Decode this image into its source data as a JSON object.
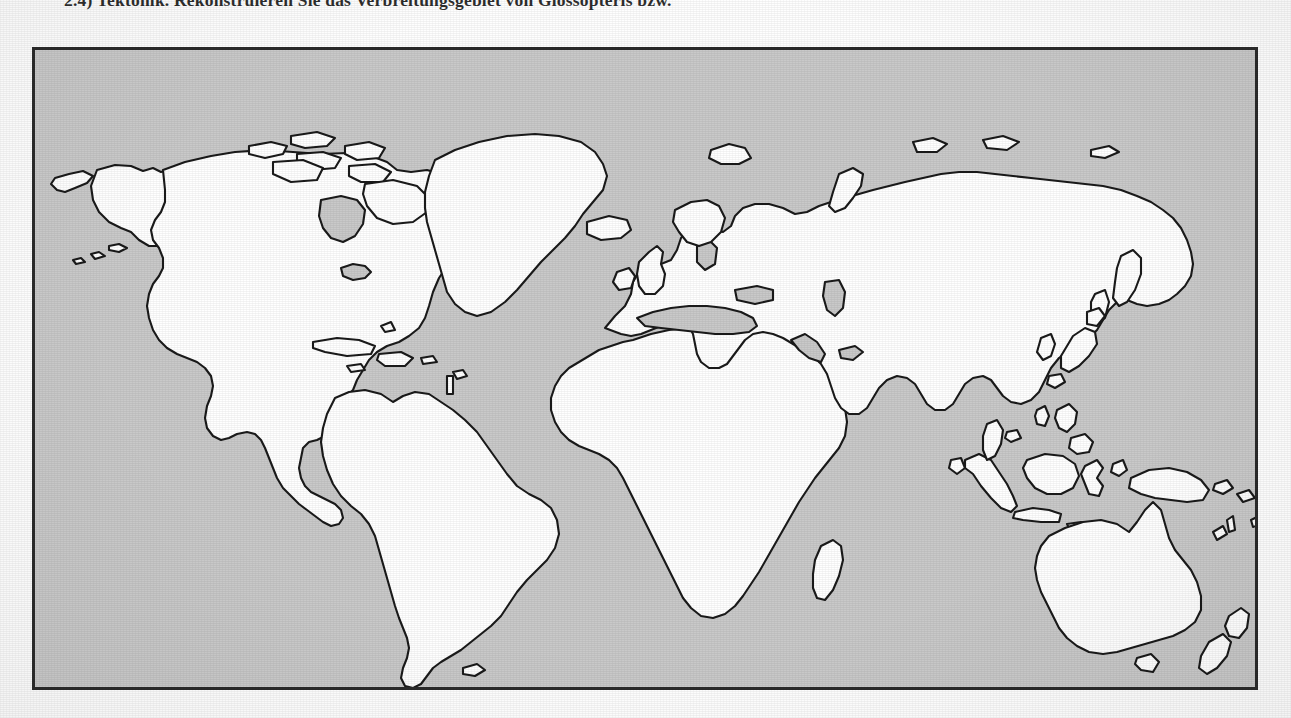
{
  "page": {
    "background_color": "#fefefe",
    "exercise_text": "2.4) Tektonik. Rekonstruieren Sie das Verbreitungsgebiet von Glossopteris bzw."
  },
  "map_figure": {
    "title": "Weltkarte Umrisskarte",
    "frame_color": "#2b2b2b",
    "ocean_color": "#c9c9c9",
    "land_color": "#ffffff",
    "coastline_color": "#1a1a1a",
    "projection": "Miller cylindrical",
    "labels": [],
    "graticule": "none",
    "antarctica_shown": "no",
    "regions": [
      "North America",
      "Greenland",
      "South America",
      "Africa",
      "Europe",
      "Asia",
      "Australia",
      "New Zealand",
      "Indonesia",
      "Philippines",
      "Japan",
      "Madagascar",
      "Iceland",
      "British Isles",
      "Caribbean"
    ]
  }
}
